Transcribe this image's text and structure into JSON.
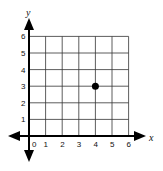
{
  "chart_data": {
    "type": "scatter",
    "title": "",
    "xlabel": "x",
    "ylabel": "y",
    "xlim": [
      0,
      6
    ],
    "ylim": [
      0,
      6
    ],
    "grid": true,
    "x_ticks": [
      "0",
      "1",
      "2",
      "3",
      "4",
      "5",
      "6"
    ],
    "y_ticks": [
      "1",
      "2",
      "3",
      "4",
      "5",
      "6"
    ],
    "points": [
      {
        "x": 4,
        "y": 3
      }
    ]
  },
  "colors": {
    "grid": "#333333",
    "axis": "#000000",
    "point": "#000000"
  }
}
